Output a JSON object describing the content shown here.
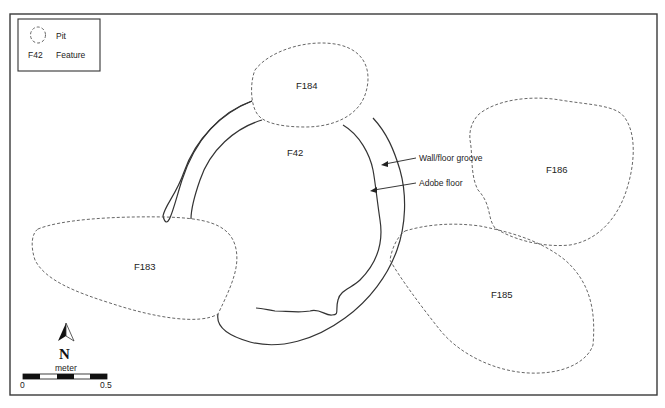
{
  "legend": {
    "items": [
      {
        "symbol": "dashed-outline",
        "label": "Pit"
      },
      {
        "symbol": "F42",
        "label": "Feature"
      }
    ]
  },
  "features": {
    "F42": "F42",
    "F183": "F183",
    "F184": "F184",
    "F185": "F185",
    "F186": "F186"
  },
  "annotations": {
    "wall_groove": "Wall/floor groove",
    "adobe_floor": "Adobe floor"
  },
  "north_arrow": {
    "label": "N"
  },
  "scale_bar": {
    "unit": "meter",
    "min_label": "0",
    "max_label": "0.5",
    "segments": 5
  },
  "colors": {
    "line": "#333333",
    "pit_outline": "#555555",
    "background": "#ffffff"
  }
}
